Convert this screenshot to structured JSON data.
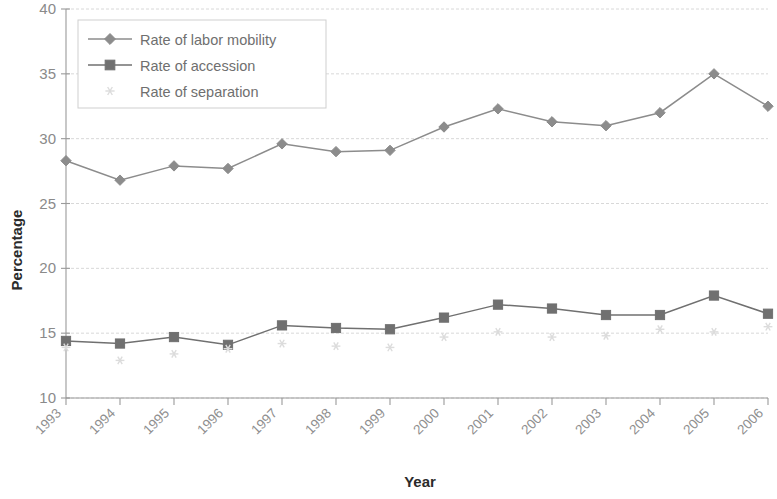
{
  "chart_data": {
    "type": "line",
    "title": "",
    "xlabel": "Year",
    "ylabel": "Percentage",
    "categories": [
      "1993",
      "1994",
      "1995",
      "1996",
      "1997",
      "1998",
      "1999",
      "2000",
      "2001",
      "2002",
      "2003",
      "2004",
      "2005",
      "2006"
    ],
    "x": [
      1993,
      1994,
      1995,
      1996,
      1997,
      1998,
      1999,
      2000,
      2001,
      2002,
      2003,
      2004,
      2005,
      2006
    ],
    "ylim": [
      10,
      40
    ],
    "ytick_labels": [
      "10",
      "15",
      "20",
      "25",
      "30",
      "35",
      "40"
    ],
    "yticks": [
      10,
      15,
      20,
      25,
      30,
      35,
      40
    ],
    "grid": true,
    "legend_position": "top-left",
    "series": [
      {
        "name": "Rate of labor mobility",
        "marker": "diamond",
        "color": "#8c8c8c",
        "values": [
          28.3,
          26.8,
          27.9,
          27.7,
          29.6,
          29.0,
          29.1,
          30.9,
          32.3,
          31.3,
          31.0,
          32.0,
          35.0,
          32.5
        ]
      },
      {
        "name": "Rate of accession",
        "marker": "square",
        "color": "#707070",
        "values": [
          14.4,
          14.2,
          14.7,
          14.1,
          15.6,
          15.4,
          15.3,
          16.2,
          17.2,
          16.9,
          16.4,
          16.4,
          17.9,
          16.5
        ]
      },
      {
        "name": "Rate of separation",
        "marker": "asterisk",
        "color": "#dcdcdc",
        "values": [
          13.9,
          12.9,
          13.4,
          13.8,
          14.2,
          14.0,
          13.9,
          14.7,
          15.1,
          14.7,
          14.8,
          15.3,
          15.1,
          15.5
        ]
      }
    ]
  },
  "axes": {
    "y_title": "Percentage",
    "x_title": "Year"
  },
  "legend": {
    "items": [
      {
        "label": "Rate of labor mobility",
        "marker": "diamond-marker"
      },
      {
        "label": "Rate of accession",
        "marker": "square-marker"
      },
      {
        "label": "Rate of separation",
        "marker": "asterisk-marker"
      }
    ]
  },
  "colors": {
    "grid": "#d8d8d8",
    "axis": "#9a9a9a",
    "mobility": "#8c8c8c",
    "accession": "#707070",
    "separation": "#dcdcdc",
    "text": "#8a8a8a",
    "title_text": "#2b2b2b"
  }
}
